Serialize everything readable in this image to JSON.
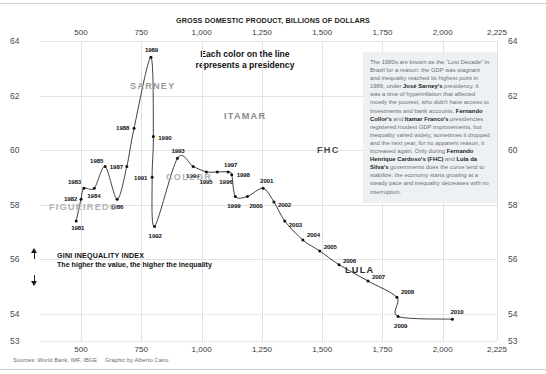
{
  "headline": "Each color on the line\nrepresents a presidency",
  "headline_line1": "Each color on the line",
  "headline_line2": "represents a presidency",
  "xaxis": {
    "title": "GROSS DOMESTIC PRODUCT, BILLIONS OF DOLLARS",
    "ticks": [
      "500",
      "750",
      "1,000",
      "1,250",
      "1,500",
      "1,750",
      "2,000",
      "2,225"
    ]
  },
  "yaxis": {
    "ticks": [
      "64",
      "62",
      "60",
      "58",
      "56",
      "54",
      "53"
    ]
  },
  "gini": {
    "line1": "GINI INEQUALITY INDEX",
    "line2": "The higher the value, the higher the inequality"
  },
  "annotation": {
    "p1_a": "The 1980s are known as the “Lost Decade” in Brazil for a reason: the GDP was stagnant and inequality reached its highest point in 1989, under ",
    "b1": "José Sarney's",
    "p1_b": " presidency. It was a time of hyperinflation that affected mostly the poorest, who didn't have access to investments and bank accounts. ",
    "b2": "Fernando Collor's",
    "p1_c": " and ",
    "b3": "Itamar Franco's",
    "p1_d": " presidencies registered modest GDP improvements, but inequality varied widely, sometimes it dropped and the next year, for no apparent reason, it increased again. Only during ",
    "b4": "Fernando Henrique Cardoso's (FHC)",
    "p1_e": " and ",
    "b5": "Lula da Silva's",
    "p1_f": " governments does the curve tend to stabilize: the economy starts growing at a steady pace and inequality decreases with no interruption."
  },
  "source": {
    "sources": "Sources: World Bank, IMF, IBGE",
    "credit": "Graphic by Alberto Cairo"
  },
  "presidencies": [
    {
      "name": "FIGUEIREDO",
      "color": "#b3b3b3",
      "x": 49,
      "y": 202
    },
    {
      "name": "SARNEY",
      "color": "#9a9a9a",
      "x": 130,
      "y": 81
    },
    {
      "name": "COLLOR",
      "color": "#b0b0b0",
      "x": 166,
      "y": 172
    },
    {
      "name": "ITAMAR",
      "color": "#8a8a8a",
      "x": 224,
      "y": 111
    },
    {
      "name": "FHC",
      "color": "#4a4a4a",
      "x": 317,
      "y": 145
    },
    {
      "name": "LULA",
      "color": "#2a2a2a",
      "x": 345,
      "y": 265
    }
  ],
  "chart_data": {
    "type": "line",
    "title": "Each color on the line represents a presidency",
    "xlabel": "GROSS DOMESTIC PRODUCT, BILLIONS OF DOLLARS",
    "ylabel": "GINI INEQUALITY INDEX",
    "xlim": [
      330,
      2225
    ],
    "ylim": [
      53,
      64
    ],
    "xticks": [
      500,
      750,
      1000,
      1250,
      1500,
      1750,
      2000,
      2225
    ],
    "yticks": [
      53,
      54,
      56,
      58,
      60,
      62,
      64
    ],
    "grid": true,
    "legend": "none",
    "point_label_field": "year",
    "series": [
      {
        "name": "Brazil GDP vs Gini index, 1981-2010",
        "points": [
          {
            "year": "1981",
            "gdp": 480,
            "gini": 57.4,
            "president": "FIGUEIREDO"
          },
          {
            "year": "1982",
            "gdp": 500,
            "gini": 58.2,
            "president": "FIGUEIREDO"
          },
          {
            "year": "1983",
            "gdp": 512,
            "gini": 58.6,
            "president": "FIGUEIREDO"
          },
          {
            "year": "1984",
            "gdp": 555,
            "gini": 58.6,
            "president": "FIGUEIREDO"
          },
          {
            "year": "1985",
            "gdp": 600,
            "gini": 59.4,
            "president": "SARNEY"
          },
          {
            "year": "1986",
            "gdp": 650,
            "gini": 58.2,
            "president": "SARNEY"
          },
          {
            "year": "1987",
            "gdp": 690,
            "gini": 59.4,
            "president": "SARNEY"
          },
          {
            "year": "1988",
            "gdp": 720,
            "gini": 60.8,
            "president": "SARNEY"
          },
          {
            "year": "1989",
            "gdp": 790,
            "gini": 63.4,
            "president": "SARNEY"
          },
          {
            "year": "1990",
            "gdp": 800,
            "gini": 60.5,
            "president": "COLLOR"
          },
          {
            "year": "1991",
            "gdp": 795,
            "gini": 59.0,
            "president": "COLLOR"
          },
          {
            "year": "1992",
            "gdp": 805,
            "gini": 57.2,
            "president": "COLLOR"
          },
          {
            "year": "1993",
            "gdp": 900,
            "gini": 59.7,
            "president": "ITAMAR"
          },
          {
            "year": "1994",
            "gdp": 965,
            "gini": 59.4,
            "president": "ITAMAR"
          },
          {
            "year": "1995",
            "gdp": 1020,
            "gini": 59.2,
            "president": "FHC"
          },
          {
            "year": "1996",
            "gdp": 1065,
            "gini": 59.2,
            "president": "FHC"
          },
          {
            "year": "1997",
            "gdp": 1110,
            "gini": 59.2,
            "president": "FHC"
          },
          {
            "year": "1998",
            "gdp": 1125,
            "gini": 59.1,
            "president": "FHC"
          },
          {
            "year": "1999",
            "gdp": 1140,
            "gini": 58.3,
            "president": "FHC"
          },
          {
            "year": "2000",
            "gdp": 1190,
            "gini": 58.3,
            "president": "FHC"
          },
          {
            "year": "2001",
            "gdp": 1255,
            "gini": 58.6,
            "president": "FHC"
          },
          {
            "year": "2002",
            "gdp": 1300,
            "gini": 58.1,
            "president": "FHC"
          },
          {
            "year": "2003",
            "gdp": 1345,
            "gini": 57.4,
            "president": "LULA"
          },
          {
            "year": "2004",
            "gdp": 1420,
            "gini": 56.7,
            "president": "LULA"
          },
          {
            "year": "2005",
            "gdp": 1490,
            "gini": 56.3,
            "president": "LULA"
          },
          {
            "year": "2006",
            "gdp": 1570,
            "gini": 55.8,
            "president": "LULA"
          },
          {
            "year": "2007",
            "gdp": 1690,
            "gini": 55.2,
            "president": "LULA"
          },
          {
            "year": "2008",
            "gdp": 1810,
            "gini": 54.6,
            "president": "LULA"
          },
          {
            "year": "2009",
            "gdp": 1815,
            "gini": 53.9,
            "president": "LULA"
          },
          {
            "year": "2010",
            "gdp": 2040,
            "gini": 53.8,
            "president": "LULA"
          }
        ]
      }
    ]
  }
}
